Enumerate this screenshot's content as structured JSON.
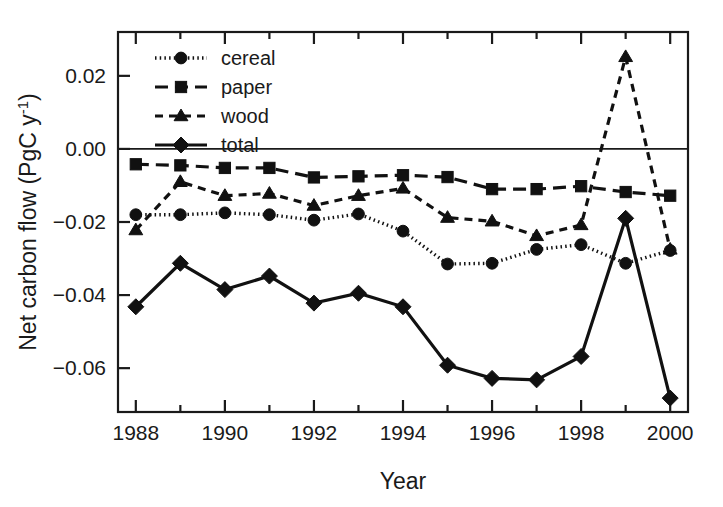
{
  "chart_data": {
    "type": "line",
    "title": "",
    "xlabel": "Year",
    "ylabel": "Net carbon flow (PgC y-1)",
    "ylabel_main": "Net carbon flow (PgC y",
    "ylabel_sup": "-1",
    "ylabel_tail": ")",
    "x": [
      1988,
      1989,
      1990,
      1991,
      1992,
      1993,
      1994,
      1995,
      1996,
      1997,
      1998,
      1999,
      2000
    ],
    "xlim": [
      1987.6,
      2000.4
    ],
    "ylim": [
      -0.072,
      0.032
    ],
    "xticks": [
      1988,
      1990,
      1992,
      1994,
      1996,
      1998,
      2000
    ],
    "xticklabels": [
      "1988",
      "1990",
      "1992",
      "1994",
      "1996",
      "1998",
      "2000"
    ],
    "xminorticks": [
      1989,
      1991,
      1993,
      1995,
      1997,
      1999
    ],
    "yticks": [
      0.02,
      0.0,
      -0.02,
      -0.04,
      -0.06
    ],
    "yticklabels": [
      "0.02",
      "0.00",
      "−0.02",
      "−0.04",
      "−0.06"
    ],
    "grid": false,
    "zeroline": 0.0,
    "legend_position": "upper-left-inside",
    "series": [
      {
        "name": "cereal",
        "marker": "circle",
        "linestyle": "dotted",
        "color": "#111111",
        "values": [
          -0.018,
          -0.018,
          -0.0175,
          -0.018,
          -0.0195,
          -0.0178,
          -0.0225,
          -0.0315,
          -0.0313,
          -0.0275,
          -0.0262,
          -0.0313,
          -0.0278
        ]
      },
      {
        "name": "paper",
        "marker": "square",
        "linestyle": "dashed-long",
        "color": "#111111",
        "values": [
          -0.0042,
          -0.0045,
          -0.0052,
          -0.0052,
          -0.0078,
          -0.0075,
          -0.0072,
          -0.0077,
          -0.011,
          -0.011,
          -0.0102,
          -0.0118,
          -0.0128
        ]
      },
      {
        "name": "wood",
        "marker": "triangle",
        "linestyle": "dashed",
        "color": "#111111",
        "values": [
          -0.0222,
          -0.009,
          -0.0128,
          -0.0122,
          -0.0155,
          -0.0128,
          -0.0108,
          -0.0188,
          -0.0198,
          -0.0238,
          -0.0208,
          0.0252,
          -0.0275
        ]
      },
      {
        "name": "total",
        "marker": "diamond",
        "linestyle": "solid",
        "color": "#111111",
        "values": [
          -0.0432,
          -0.0313,
          -0.0385,
          -0.0348,
          -0.0422,
          -0.0395,
          -0.0432,
          -0.0592,
          -0.0628,
          -0.0632,
          -0.0568,
          -0.019,
          -0.0682
        ]
      }
    ]
  },
  "legend": {
    "entries": [
      {
        "label": "cereal"
      },
      {
        "label": "paper"
      },
      {
        "label": "wood"
      },
      {
        "label": "total"
      }
    ]
  }
}
